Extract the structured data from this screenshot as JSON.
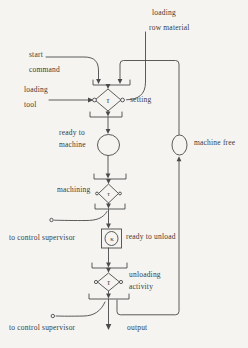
{
  "symbols": {
    "tau": "τ",
    "kappa": "κ"
  },
  "labels": {
    "loading_raw_material": [
      "loading",
      "row material"
    ],
    "start_command": [
      "start",
      "command"
    ],
    "loading_tool": [
      "loading",
      "tool"
    ],
    "setting": "setting",
    "ready_to_machine": [
      "ready to",
      "machine"
    ],
    "machine_free": "machine free",
    "machining": "machining",
    "to_control_supervisor_upper": "to control supervisor",
    "ready_to_unload": "ready to unload",
    "unloading_activity": [
      "unloading",
      "activity"
    ],
    "to_control_supervisor_lower": "to control supervisor",
    "output": "output"
  },
  "colors": {
    "ink": "#4a4a4a",
    "paper": "#f5f4f1"
  }
}
